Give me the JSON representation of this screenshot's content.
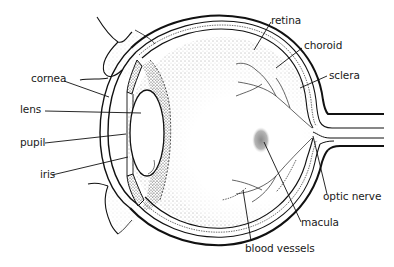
{
  "diagram": {
    "labels": {
      "retina": "retina",
      "choroid": "choroid",
      "sclera": "sclera",
      "cornea": "cornea",
      "lens": "lens",
      "pupil": "pupil",
      "iris": "iris",
      "optic_nerve": "optic nerve",
      "macula": "macula",
      "blood_vessels": "blood vessels"
    },
    "colors": {
      "ink": "#111111",
      "background": "#ffffff",
      "macula_shade": "#9a9a9a",
      "stipple": "#555555"
    }
  }
}
